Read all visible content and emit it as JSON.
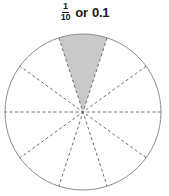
{
  "caption": {
    "fraction_numerator": "1",
    "fraction_denominator": "10",
    "connector": "or",
    "decimal": "0.1"
  },
  "chart_data": {
    "type": "pie",
    "categories": [
      "shaded part",
      "unshaded part"
    ],
    "values": [
      1,
      9
    ],
    "total_slices": 10,
    "shaded_slices": 1,
    "slice_fraction": "1/10",
    "slice_decimal": 0.1,
    "slice_degrees": 36,
    "start_angle_deg": -18,
    "end_angle_deg": 18,
    "legend": "none",
    "grid": false,
    "colors": {
      "shaded_fill": "#c9c9c9",
      "unshaded_fill": "#ffffff",
      "outline": "#8c8c8c",
      "divider": "#6e6e6e",
      "text": "#1a1a1a"
    },
    "geometry": {
      "center_x": 83,
      "center_y": 88,
      "radius": 78
    },
    "xlabel": "",
    "ylabel": ""
  }
}
